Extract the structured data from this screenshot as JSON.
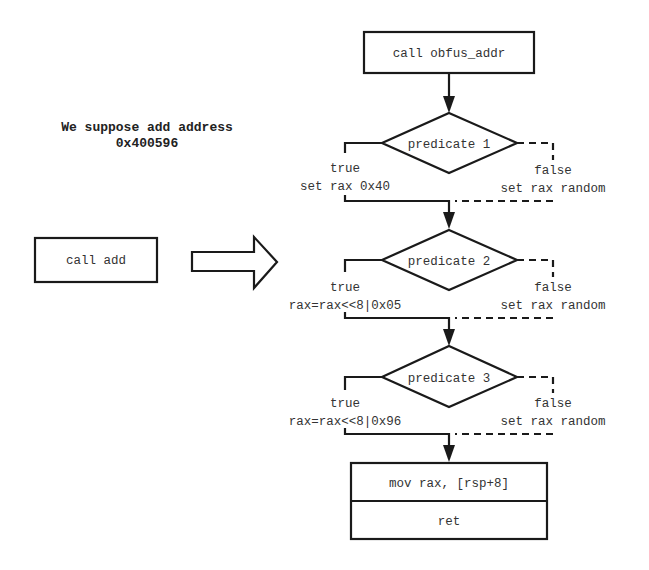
{
  "note": {
    "line1": "We suppose add address",
    "line2": "0x400596"
  },
  "original": {
    "instruction": "call add"
  },
  "transform_arrow": "block-arrow-right",
  "flow": {
    "entry": "call obfus_addr",
    "predicates": [
      {
        "label": "predicate 1",
        "true_label": "true",
        "true_action": "set rax 0x40",
        "false_label": "false",
        "false_action": "set rax random"
      },
      {
        "label": "predicate 2",
        "true_label": "true",
        "true_action": "rax=rax<<8|0x05",
        "false_label": "false",
        "false_action": "set rax random"
      },
      {
        "label": "predicate 3",
        "true_label": "true",
        "true_action": "rax=rax<<8|0x96",
        "false_label": "false",
        "false_action": "set rax random"
      }
    ],
    "exit_block": [
      "mov rax, [rsp+8]",
      "ret"
    ]
  }
}
